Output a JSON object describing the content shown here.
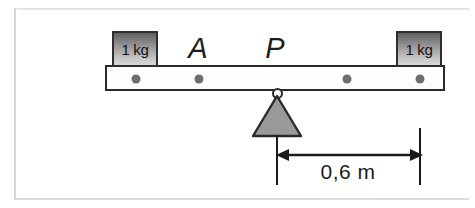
{
  "figure": {
    "type": "lever-balance-diagram",
    "beam": {
      "dot_count": 4,
      "dots": [
        {
          "name": "beam-hole-1",
          "x": 134,
          "y": 77
        },
        {
          "name": "beam-hole-2",
          "x": 197,
          "y": 77
        },
        {
          "name": "beam-hole-3",
          "x": 345,
          "y": 77
        },
        {
          "name": "beam-hole-4",
          "x": 418,
          "y": 77
        }
      ]
    },
    "masses": [
      {
        "id": "mass-left",
        "label": "1 kg",
        "value": 1,
        "unit": "kg"
      },
      {
        "id": "mass-right",
        "label": "1 kg",
        "value": 1,
        "unit": "kg"
      }
    ],
    "point_labels": [
      {
        "id": "label-a",
        "text": "A"
      },
      {
        "id": "label-p",
        "text": "P"
      }
    ],
    "fulcrum": {
      "name": "pivot-triangle",
      "fill_color": "#9a9a9a",
      "stroke_color": "#2a2a2a"
    },
    "dimension": {
      "text": "0,6 m",
      "value": 0.6,
      "unit": "m",
      "separator": ","
    },
    "colors": {
      "beam_stroke": "#2a2a2a",
      "beam_fill": "#fdfdfd",
      "dot_fill": "#6e6e6e",
      "block_top": "#5e5e5e",
      "block_bottom": "#d6d6d6",
      "triangle_fill": "#9a9a9a",
      "annotation": "#1a1a1a",
      "page_frame": "#d8d8d8"
    }
  }
}
